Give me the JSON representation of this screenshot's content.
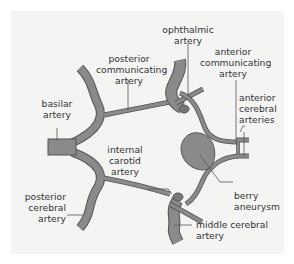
{
  "diagram": {
    "type": "anatomical-diagram",
    "colors": {
      "background": "#ffffff",
      "panel": "#f4f4f3",
      "vessel_fill": "#8a8a8a",
      "vessel_outline": "#555555",
      "label_text": "#333333"
    },
    "labels": {
      "ophthalmic_artery": [
        "ophthalmic",
        "artery"
      ],
      "posterior_communicating_artery": [
        "posterior",
        "communicating",
        "artery"
      ],
      "anterior_communicating_artery": [
        "anterior",
        "communicating",
        "artery"
      ],
      "basilar_artery": [
        "basilar",
        "artery"
      ],
      "anterior_cerebral_arteries": [
        "anterior",
        "cerebral",
        "arteries"
      ],
      "internal_carotid_artery": [
        "internal",
        "carotid",
        "artery"
      ],
      "berry_aneurysm": [
        "berry",
        "aneurysm"
      ],
      "posterior_cerebral_artery": [
        "posterior",
        "cerebral",
        "artery"
      ],
      "middle_cerebral_artery": [
        "middle cerebral",
        "artery"
      ]
    }
  }
}
